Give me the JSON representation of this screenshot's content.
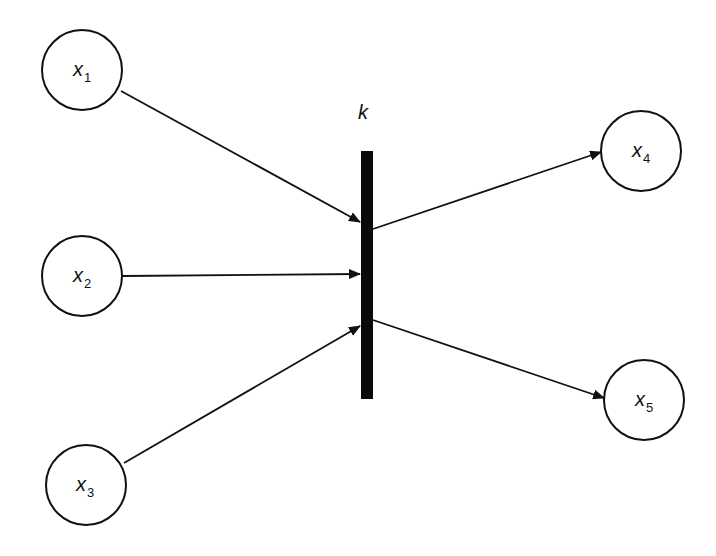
{
  "diagram": {
    "type": "petri-net-transition",
    "transition": {
      "label": "k"
    },
    "nodes": [
      {
        "id": "x1",
        "base": "x",
        "sub": "1",
        "role": "input"
      },
      {
        "id": "x2",
        "base": "x",
        "sub": "2",
        "role": "input"
      },
      {
        "id": "x3",
        "base": "x",
        "sub": "3",
        "role": "input"
      },
      {
        "id": "x4",
        "base": "x",
        "sub": "4",
        "role": "output"
      },
      {
        "id": "x5",
        "base": "x",
        "sub": "5",
        "role": "output"
      }
    ],
    "edges": [
      {
        "from": "x1",
        "to": "k"
      },
      {
        "from": "x2",
        "to": "k"
      },
      {
        "from": "x3",
        "to": "k"
      },
      {
        "from": "k",
        "to": "x4"
      },
      {
        "from": "k",
        "to": "x5"
      }
    ]
  }
}
